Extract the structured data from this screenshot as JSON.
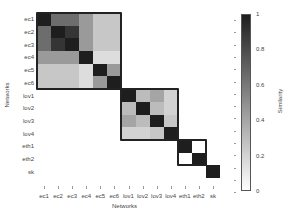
{
  "chart_data": {
    "type": "heatmap",
    "title": "",
    "xlabel": "Networks",
    "ylabel": "Networks",
    "colorbar": {
      "label": "Similarity",
      "range": [
        0,
        1
      ],
      "ticks": [
        "0",
        "0.2",
        "0.4",
        "0.6",
        "0.8",
        "1"
      ],
      "colormap": "white-to-black (greys)"
    },
    "labels": [
      "ec1",
      "ec2",
      "ec3",
      "ec4",
      "ec5",
      "ec6",
      "lov1",
      "lov2",
      "lov3",
      "lov4",
      "eth1",
      "eth2",
      "sk"
    ],
    "values": [
      [
        1.0,
        0.65,
        0.65,
        0.45,
        0.25,
        0.25,
        0,
        0,
        0,
        0,
        0,
        0,
        0
      ],
      [
        0.65,
        1.0,
        0.9,
        0.45,
        0.25,
        0.25,
        0,
        0,
        0,
        0,
        0,
        0,
        0
      ],
      [
        0.65,
        0.9,
        1.0,
        0.45,
        0.25,
        0.25,
        0,
        0,
        0,
        0,
        0,
        0,
        0
      ],
      [
        0.45,
        0.45,
        0.45,
        1.0,
        0.15,
        0.15,
        0,
        0,
        0,
        0,
        0,
        0,
        0
      ],
      [
        0.25,
        0.25,
        0.25,
        0.15,
        1.0,
        0.45,
        0,
        0,
        0,
        0,
        0,
        0,
        0
      ],
      [
        0.25,
        0.25,
        0.25,
        0.15,
        0.45,
        1.0,
        0,
        0,
        0,
        0,
        0,
        0,
        0
      ],
      [
        0,
        0,
        0,
        0,
        0,
        0,
        1.0,
        0.3,
        0.4,
        0.2,
        0,
        0,
        0
      ],
      [
        0,
        0,
        0,
        0,
        0,
        0,
        0.3,
        1.0,
        0.3,
        0.2,
        0,
        0,
        0
      ],
      [
        0,
        0,
        0,
        0,
        0,
        0,
        0.4,
        0.3,
        1.0,
        0.25,
        0,
        0,
        0
      ],
      [
        0,
        0,
        0,
        0,
        0,
        0,
        0.2,
        0.2,
        0.25,
        1.0,
        0,
        0,
        0
      ],
      [
        0,
        0,
        0,
        0,
        0,
        0,
        0,
        0,
        0,
        0,
        1.0,
        0.0,
        0
      ],
      [
        0,
        0,
        0,
        0,
        0,
        0,
        0,
        0,
        0,
        0,
        0.0,
        1.0,
        0
      ],
      [
        0,
        0,
        0,
        0,
        0,
        0,
        0,
        0,
        0,
        0,
        0,
        0,
        1.0
      ]
    ],
    "blocks": [
      {
        "name": "ec",
        "start": 0,
        "end": 5
      },
      {
        "name": "lov",
        "start": 6,
        "end": 9
      },
      {
        "name": "eth",
        "start": 10,
        "end": 11
      }
    ],
    "grid": false,
    "legend_position": "right (colorbar)"
  }
}
